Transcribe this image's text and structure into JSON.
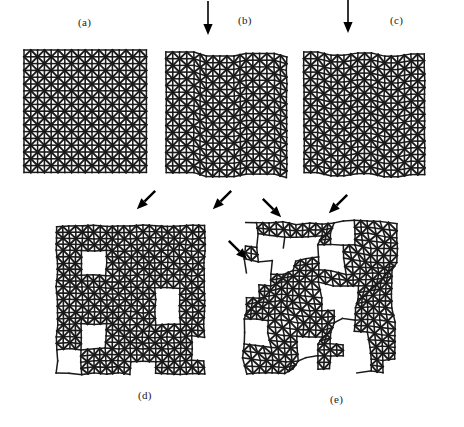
{
  "figure": {
    "caption_present": false,
    "background_color": "#ffffff",
    "line_color": "#1a1a1a",
    "arrow_color": "#000000"
  },
  "panels": [
    {
      "id": "a",
      "label": "(a)",
      "label_x": 78,
      "label_y": 16,
      "lattice_x": 24,
      "lattice_y": 50,
      "cols": 9,
      "rows": 9,
      "cell": 13.6,
      "state": "pristine",
      "arrows": []
    },
    {
      "id": "b",
      "label": "(b)",
      "label_x": 238,
      "label_y": 14,
      "lattice_x": 166,
      "lattice_y": 52,
      "cols": 9,
      "rows": 9,
      "cell": 13.4,
      "state": "vertical-slip-bands",
      "arrows": [
        {
          "dir": "down",
          "x": 208,
          "y": 18,
          "len": 34
        }
      ]
    },
    {
      "id": "c",
      "label": "(c)",
      "label_x": 390,
      "label_y": 14,
      "lattice_x": 304,
      "lattice_y": 52,
      "cols": 9,
      "rows": 9,
      "cell": 13.4,
      "state": "vertical-slip-bands-dense",
      "arrows": [
        {
          "dir": "down",
          "x": 348,
          "y": 16,
          "len": 34
        }
      ]
    },
    {
      "id": "d",
      "label": "(d)",
      "label_x": 138,
      "label_y": 389,
      "lattice_x": 57,
      "lattice_y": 226,
      "cols": 12,
      "rows": 12,
      "cell": 12.3,
      "state": "distributed-microvoids",
      "arrows": [
        {
          "dir": "down-left",
          "x": 146,
          "y": 200,
          "len": 26
        },
        {
          "dir": "down-left",
          "x": 222,
          "y": 200,
          "len": 26
        }
      ]
    },
    {
      "id": "e",
      "label": "(e)",
      "label_x": 330,
      "label_y": 393,
      "lattice_x": 245,
      "lattice_y": 222,
      "cols": 12,
      "rows": 12,
      "cell": 12.4,
      "state": "diagonal-shear-bands",
      "arrows": [
        {
          "dir": "down-right",
          "x": 238,
          "y": 250,
          "len": 26
        },
        {
          "dir": "down-right",
          "x": 272,
          "y": 208,
          "len": 26
        },
        {
          "dir": "down-left",
          "x": 338,
          "y": 204,
          "len": 26
        }
      ]
    }
  ],
  "structure": {
    "unit": "rotated-square-with-cross-bracing",
    "description": "square lattice of 45-degree-rotated square cells with horizontal and vertical cross members"
  }
}
